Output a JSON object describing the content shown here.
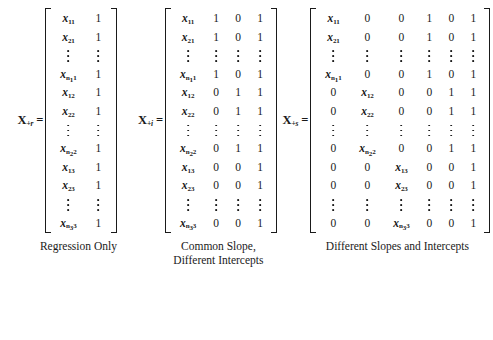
{
  "figure": {
    "background_color": "#ffffff",
    "text_color": "#1a1a1a",
    "equals_sign": "=",
    "panels": [
      {
        "id": "regression-only",
        "label_base": "X",
        "label_subscript": "+r",
        "caption": "Regression Only",
        "columns": 2,
        "rows": [
          {
            "type": "data",
            "cells": [
              "x<sub>11</sub>",
              "1"
            ]
          },
          {
            "type": "data",
            "cells": [
              "x<sub>21</sub>",
              "1"
            ]
          },
          {
            "type": "dots",
            "cells": [
              "",
              ""
            ]
          },
          {
            "type": "data",
            "cells": [
              "x<sub>n<sub>1</sub>1</sub>",
              "1"
            ]
          },
          {
            "type": "data",
            "cells": [
              "x<sub>12</sub>",
              "1"
            ]
          },
          {
            "type": "data",
            "cells": [
              "x<sub>22</sub>",
              "1"
            ]
          },
          {
            "type": "dots",
            "cells": [
              "",
              ""
            ]
          },
          {
            "type": "data",
            "cells": [
              "x<sub>n<sub>2</sub>2</sub>",
              "1"
            ]
          },
          {
            "type": "data",
            "cells": [
              "x<sub>13</sub>",
              "1"
            ]
          },
          {
            "type": "data",
            "cells": [
              "x<sub>23</sub>",
              "1"
            ]
          },
          {
            "type": "dots",
            "cells": [
              "",
              ""
            ]
          },
          {
            "type": "data",
            "cells": [
              "x<sub>n<sub>3</sub>3</sub>",
              "1"
            ]
          }
        ]
      },
      {
        "id": "common-slope-different-intercepts",
        "label_base": "X",
        "label_subscript": "+i",
        "caption": "Common Slope,\nDifferent Intercepts",
        "columns": 4,
        "rows": [
          {
            "type": "data",
            "cells": [
              "x<sub>11</sub>",
              "1",
              "0",
              "1"
            ]
          },
          {
            "type": "data",
            "cells": [
              "x<sub>21</sub>",
              "1",
              "0",
              "1"
            ]
          },
          {
            "type": "dots",
            "cells": [
              "",
              "",
              "",
              ""
            ]
          },
          {
            "type": "data",
            "cells": [
              "x<sub>n<sub>1</sub>1</sub>",
              "1",
              "0",
              "1"
            ]
          },
          {
            "type": "data",
            "cells": [
              "x<sub>12</sub>",
              "0",
              "1",
              "1"
            ]
          },
          {
            "type": "data",
            "cells": [
              "x<sub>22</sub>",
              "0",
              "1",
              "1"
            ]
          },
          {
            "type": "dots",
            "cells": [
              "",
              "",
              "",
              ""
            ]
          },
          {
            "type": "data",
            "cells": [
              "x<sub>n<sub>2</sub>2</sub>",
              "0",
              "1",
              "1"
            ]
          },
          {
            "type": "data",
            "cells": [
              "x<sub>13</sub>",
              "0",
              "0",
              "1"
            ]
          },
          {
            "type": "data",
            "cells": [
              "x<sub>23</sub>",
              "0",
              "0",
              "1"
            ]
          },
          {
            "type": "dots",
            "cells": [
              "",
              "",
              "",
              ""
            ]
          },
          {
            "type": "data",
            "cells": [
              "x<sub>n<sub>3</sub>3</sub>",
              "0",
              "0",
              "1"
            ]
          }
        ]
      },
      {
        "id": "different-slopes-and-intercepts",
        "label_base": "X",
        "label_subscript": "+s",
        "caption": "Different Slopes and Intercepts",
        "columns": 6,
        "rows": [
          {
            "type": "data",
            "cells": [
              "x<sub>11</sub>",
              "0",
              "0",
              "1",
              "0",
              "1"
            ]
          },
          {
            "type": "data",
            "cells": [
              "x<sub>21</sub>",
              "0",
              "0",
              "1",
              "0",
              "1"
            ]
          },
          {
            "type": "dots",
            "cells": [
              "",
              "",
              "",
              "",
              "",
              ""
            ]
          },
          {
            "type": "data",
            "cells": [
              "x<sub>n<sub>1</sub>1</sub>",
              "0",
              "0",
              "1",
              "0",
              "1"
            ]
          },
          {
            "type": "data",
            "cells": [
              "0",
              "x<sub>12</sub>",
              "0",
              "0",
              "1",
              "1"
            ]
          },
          {
            "type": "data",
            "cells": [
              "0",
              "x<sub>22</sub>",
              "0",
              "0",
              "1",
              "1"
            ]
          },
          {
            "type": "dots",
            "cells": [
              "",
              "",
              "",
              "",
              "",
              ""
            ]
          },
          {
            "type": "data",
            "cells": [
              "0",
              "x<sub>n<sub>2</sub>2</sub>",
              "0",
              "0",
              "1",
              "1"
            ]
          },
          {
            "type": "data",
            "cells": [
              "0",
              "0",
              "x<sub>13</sub>",
              "0",
              "0",
              "1"
            ]
          },
          {
            "type": "data",
            "cells": [
              "0",
              "0",
              "x<sub>23</sub>",
              "0",
              "0",
              "1"
            ]
          },
          {
            "type": "dots",
            "cells": [
              "",
              "",
              "",
              "",
              "",
              ""
            ]
          },
          {
            "type": "data",
            "cells": [
              "0",
              "0",
              "x<sub>n<sub>3</sub>3</sub>",
              "0",
              "0",
              "1"
            ]
          }
        ]
      }
    ]
  }
}
